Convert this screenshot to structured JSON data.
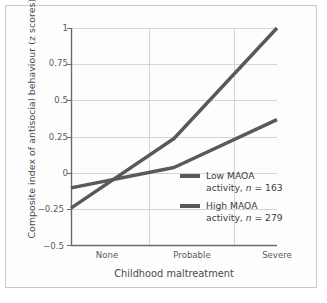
{
  "chart_data": {
    "type": "line",
    "title": "",
    "xlabel": "Childhood maltreatment",
    "ylabel": "Composite index of antisocial behaviour (z scores)",
    "categories": [
      "None",
      "Probable",
      "Severe"
    ],
    "ylim": [
      -0.5,
      1
    ],
    "yticks": [
      "1",
      "0.75",
      "0.5",
      "0.25",
      "0",
      "−0.25",
      "−0.5"
    ],
    "ytick_values": [
      1,
      0.75,
      0.5,
      0.25,
      0,
      -0.25,
      -0.5
    ],
    "grid": "horizontal-and-vertical",
    "legend_position": "inside-lower-right",
    "series": [
      {
        "name": "Low MAOA activity, n = 163",
        "label_line1": "Low MAOA",
        "label_line2_pre": "activity, ",
        "label_line2_ital": "n",
        "label_line2_post": " = 163",
        "n": 163,
        "color": "#595959",
        "values": [
          -0.24,
          0.24,
          1.0
        ]
      },
      {
        "name": "High MAOA activity, n = 279",
        "label_line1": "High MAOA",
        "label_line2_pre": "activity, ",
        "label_line2_ital": "n",
        "label_line2_post": " = 279",
        "n": 279,
        "color": "#595959",
        "values": [
          -0.1,
          0.04,
          0.37
        ]
      }
    ]
  },
  "style": {
    "line_color": "#595959",
    "grid_color": "#d5d5d5",
    "axis_color": "#6b6b6b",
    "frame_color": "#c9c9c9",
    "text_color": "#4a4a4a"
  }
}
